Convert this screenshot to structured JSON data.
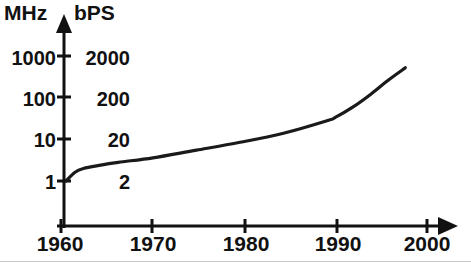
{
  "chart_data": {
    "type": "line",
    "title": "",
    "xlabel": "",
    "ylabel": "MHz",
    "ylabel_secondary": "bPS",
    "y_scale": "log",
    "grid": false,
    "legend": false,
    "xlim": [
      1960,
      2000
    ],
    "ylim": [
      1,
      3000
    ],
    "x_ticks": [
      "1960",
      "1970",
      "1980",
      "1990",
      "2000"
    ],
    "y_ticks_primary": [
      "1000",
      "100",
      "10",
      "1"
    ],
    "y_ticks_secondary": [
      "2000",
      "200",
      "20",
      "2"
    ],
    "series": [
      {
        "name": "Processor clock / modem speed",
        "x": [
          1960,
          1961,
          1962,
          1964,
          1966,
          1970,
          1975,
          1980,
          1985,
          1990,
          1991,
          1993,
          1995,
          1997,
          1999
        ],
        "values": [
          1.0,
          1.6,
          2.0,
          2.4,
          2.8,
          3.6,
          5.5,
          8.5,
          14,
          28,
          34,
          60,
          120,
          260,
          520
        ]
      }
    ]
  },
  "axes": {
    "y_primary_unit": "MHz",
    "y_secondary_unit": "bPS",
    "x_ticks": [
      {
        "label": "1960"
      },
      {
        "label": "1970"
      },
      {
        "label": "1980"
      },
      {
        "label": "1990"
      },
      {
        "label": "2000"
      }
    ],
    "y_ticks": [
      {
        "primary": "1000",
        "secondary": "2000"
      },
      {
        "primary": "100",
        "secondary": "200"
      },
      {
        "primary": "10",
        "secondary": "20"
      },
      {
        "primary": "1",
        "secondary": "2"
      }
    ]
  },
  "colors": {
    "ink": "#111111",
    "curve": "#1a1a1a",
    "background": "#ffffff",
    "edge_artifact": "#c9c9c9"
  }
}
